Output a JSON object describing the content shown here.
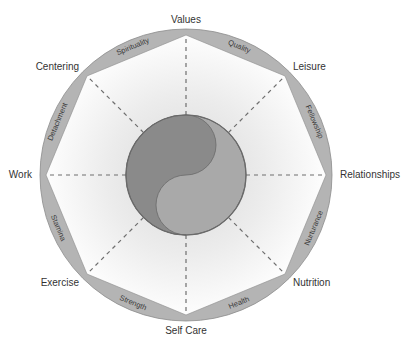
{
  "diagram": {
    "nodes": [
      {
        "label": "Values"
      },
      {
        "label": "Leisure"
      },
      {
        "label": "Relationships"
      },
      {
        "label": "Nutrition"
      },
      {
        "label": "Self Care"
      },
      {
        "label": "Exercise"
      },
      {
        "label": "Work"
      },
      {
        "label": "Centering"
      }
    ],
    "segments": [
      {
        "label": "Quality",
        "from": "Values",
        "to": "Leisure"
      },
      {
        "label": "Fellowship",
        "from": "Leisure",
        "to": "Relationships"
      },
      {
        "label": "Nurturance",
        "from": "Relationships",
        "to": "Nutrition"
      },
      {
        "label": "Health",
        "from": "Nutrition",
        "to": "Self Care"
      },
      {
        "label": "Strength",
        "from": "Self Care",
        "to": "Exercise"
      },
      {
        "label": "Stamina",
        "from": "Exercise",
        "to": "Work"
      },
      {
        "label": "Detachment",
        "from": "Work",
        "to": "Centering"
      },
      {
        "label": "Spirituality",
        "from": "Centering",
        "to": "Values"
      }
    ],
    "center": {
      "symbol": "yin-yang"
    },
    "colors": {
      "ring": "#b4b4b4",
      "ring_stroke": "#8c8c8c",
      "yin": "#8a8a8a",
      "yang": "#a9a9a9",
      "spoke": "#6e6e6e",
      "text": "#333333",
      "inner_gradient_center": "#d9d9d9",
      "inner_gradient_edge": "#ffffff"
    }
  }
}
